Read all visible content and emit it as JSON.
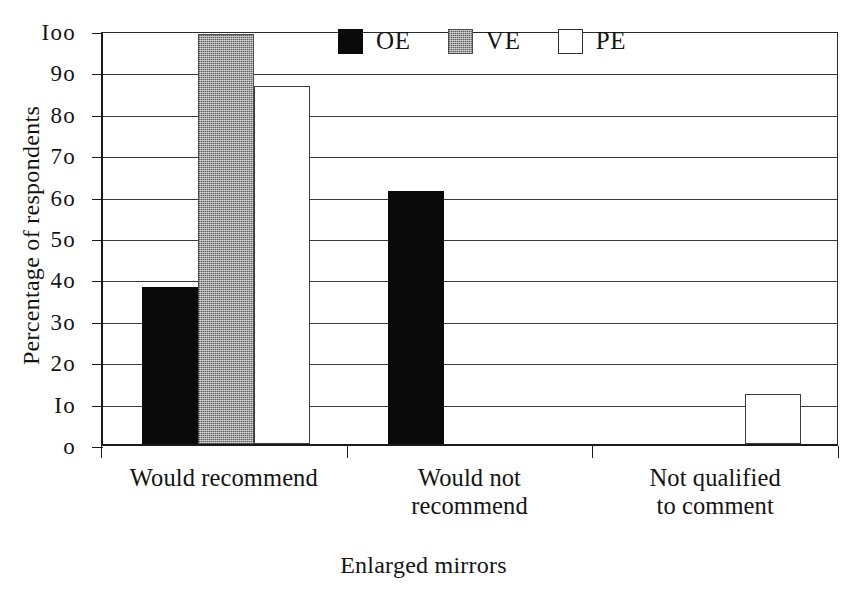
{
  "chart_data": {
    "type": "bar",
    "title": "",
    "xlabel": "Enlarged mirrors",
    "ylabel": "Percentage of respondents",
    "categories": [
      "Would recommend",
      "Would not recommend",
      "Not qualified to comment"
    ],
    "category_lines": [
      [
        "Would recommend"
      ],
      [
        "Would not",
        "recommend"
      ],
      [
        "Not qualified",
        "to comment"
      ]
    ],
    "series": [
      {
        "name": "OE",
        "color": "#0a0a0a",
        "values": [
          38,
          61,
          0
        ]
      },
      {
        "name": "VE",
        "color": "#9e9e9e",
        "values": [
          99,
          0,
          0
        ]
      },
      {
        "name": "PE",
        "color": "#ffffff",
        "values": [
          86.5,
          0,
          12
        ]
      }
    ],
    "ylim": [
      0,
      100
    ],
    "ytick_values": [
      0,
      10,
      20,
      30,
      40,
      50,
      60,
      70,
      80,
      90,
      100
    ],
    "ytick_labels": [
      "o",
      "Io",
      "2o",
      "3o",
      "4o",
      "5o",
      "6o",
      "7o",
      "8o",
      "9o",
      "Ioo"
    ],
    "grid": true,
    "grid_axis": "y",
    "legend_position": "top-center",
    "bar_style": {
      "OE": "solid-black",
      "VE": "gray-halftone",
      "PE": "white-outlined"
    }
  },
  "legend": {
    "items": [
      {
        "label": "OE",
        "swatch": "black-swatch"
      },
      {
        "label": "VE",
        "swatch": "gray-swatch"
      },
      {
        "label": "PE",
        "swatch": "white-swatch"
      }
    ]
  },
  "axes": {
    "y_title": "Percentage of respondents",
    "x_title": "Enlarged mirrors"
  }
}
